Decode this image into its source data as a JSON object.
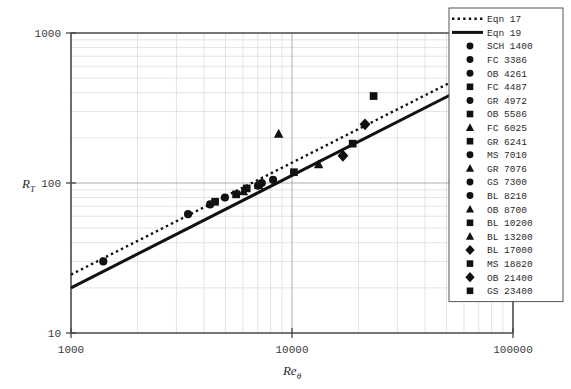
{
  "chart_data": {
    "type": "scatter",
    "title": "",
    "xlabel": "Reθ",
    "ylabel": "R_T",
    "xscale": "log",
    "yscale": "log",
    "xlim": [
      1000,
      100000
    ],
    "ylim": [
      10,
      1000
    ],
    "xticks": [
      "1000",
      "10000",
      "100000"
    ],
    "yticks": [
      "10",
      "100",
      "1000"
    ],
    "grid": true,
    "legend_position": "right",
    "series": [
      {
        "name": "Eqn 17",
        "marker": "line-dotted",
        "values": [
          [
            1000,
            24.5
          ],
          [
            60000,
            520
          ]
        ]
      },
      {
        "name": "Eqn 19",
        "marker": "line-solid",
        "values": [
          [
            1000,
            20.0
          ],
          [
            60000,
            430
          ]
        ]
      },
      {
        "name": "SCH 1400",
        "marker": "circle",
        "values": [
          [
            1400,
            30
          ]
        ]
      },
      {
        "name": "FC 3386",
        "marker": "circle",
        "values": [
          [
            3386,
            62
          ]
        ]
      },
      {
        "name": "OB 4261",
        "marker": "circle",
        "values": [
          [
            4261,
            72
          ]
        ]
      },
      {
        "name": "FC 4487",
        "marker": "square",
        "values": [
          [
            4487,
            75
          ]
        ]
      },
      {
        "name": "GR 4972",
        "marker": "circle",
        "values": [
          [
            4972,
            80
          ]
        ]
      },
      {
        "name": "OB 5586",
        "marker": "square",
        "values": [
          [
            5586,
            84
          ]
        ]
      },
      {
        "name": "FC 6025",
        "marker": "triangle",
        "values": [
          [
            6025,
            88
          ]
        ]
      },
      {
        "name": "GR 6241",
        "marker": "square",
        "values": [
          [
            6241,
            92
          ]
        ]
      },
      {
        "name": "MS 7010",
        "marker": "circle",
        "values": [
          [
            7010,
            96
          ]
        ]
      },
      {
        "name": "GR 7076",
        "marker": "triangle",
        "values": [
          [
            7076,
            97
          ]
        ]
      },
      {
        "name": "GS 7300",
        "marker": "circle",
        "values": [
          [
            7300,
            100
          ]
        ]
      },
      {
        "name": "BL 8210",
        "marker": "circle",
        "values": [
          [
            8210,
            105
          ]
        ]
      },
      {
        "name": "OB 8700",
        "marker": "triangle",
        "values": [
          [
            8700,
            213
          ]
        ]
      },
      {
        "name": "BL 10200",
        "marker": "square",
        "values": [
          [
            10200,
            118
          ]
        ]
      },
      {
        "name": "BL 13200",
        "marker": "triangle",
        "values": [
          [
            13200,
            133
          ]
        ]
      },
      {
        "name": "BL 17000",
        "marker": "diamond",
        "values": [
          [
            17000,
            152
          ]
        ]
      },
      {
        "name": "MS 18820",
        "marker": "square",
        "values": [
          [
            18820,
            183
          ]
        ]
      },
      {
        "name": "OB 21400",
        "marker": "diamond",
        "values": [
          [
            21400,
            246
          ]
        ]
      },
      {
        "name": "GS 23400",
        "marker": "square",
        "values": [
          [
            23400,
            380
          ]
        ]
      }
    ]
  },
  "legend": {
    "entries": [
      {
        "marker": "line-dotted",
        "label": "Eqn 17"
      },
      {
        "marker": "line-solid",
        "label": "Eqn 19"
      },
      {
        "marker": "circle",
        "label": "SCH 1400"
      },
      {
        "marker": "circle",
        "label": "FC  3386"
      },
      {
        "marker": "circle",
        "label": "OB  4261"
      },
      {
        "marker": "square",
        "label": "FC  4487"
      },
      {
        "marker": "circle",
        "label": "GR  4972"
      },
      {
        "marker": "square",
        "label": "OB  5586"
      },
      {
        "marker": "triangle",
        "label": "FC  6025"
      },
      {
        "marker": "square",
        "label": "GR  6241"
      },
      {
        "marker": "circle",
        "label": "MS  7010"
      },
      {
        "marker": "triangle",
        "label": "GR  7076"
      },
      {
        "marker": "circle",
        "label": "GS  7300"
      },
      {
        "marker": "circle",
        "label": "BL  8210"
      },
      {
        "marker": "triangle",
        "label": "OB  8700"
      },
      {
        "marker": "square",
        "label": "BL 10200"
      },
      {
        "marker": "triangle",
        "label": "BL 13200"
      },
      {
        "marker": "diamond",
        "label": "BL 17000"
      },
      {
        "marker": "square",
        "label": "MS 18820"
      },
      {
        "marker": "diamond",
        "label": "OB 21400"
      },
      {
        "marker": "square",
        "label": "GS 23400"
      }
    ]
  },
  "axes": {
    "y_label_main": "R",
    "y_label_sub": "T",
    "x_label_main": "Re",
    "x_label_sub": "θ",
    "y_ticks": [
      "1000",
      "100",
      "10"
    ],
    "x_ticks": [
      "1000",
      "10000",
      "100000"
    ]
  },
  "colors": {
    "marker": "#111111",
    "line": "#111111",
    "grid_major": "#9a9a9a",
    "grid_minor": "#d2d2d2",
    "border": "#555555",
    "text": "#2b2b2b",
    "background": "#ffffff"
  }
}
